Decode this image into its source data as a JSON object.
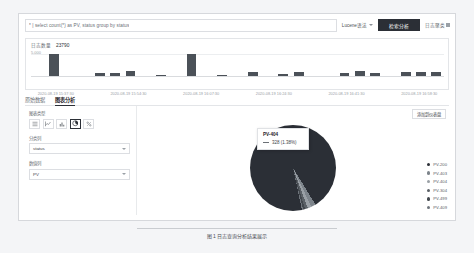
{
  "search": {
    "query": "* | select count(*) as PV, status group by status",
    "placeholder": "请输入查询语句",
    "syntax_label": "Lucene语法",
    "search_button": "检索分析",
    "right_link": "日志聚类",
    "right_link_badge": "新"
  },
  "histogram": {
    "count_label": "日志数量",
    "count_value": "23790",
    "ytick": "5,000",
    "xlabels": [
      "2020-08-19 15:37:30",
      "2020-08-19 15:54:30",
      "2020-08-19 16:07:30",
      "2020-08-19 16:24:30",
      "2020-08-19 16:41:30",
      "2020-08-19 16:58:30"
    ]
  },
  "tabs": [
    {
      "label": "原始数据",
      "active": false
    },
    {
      "label": "图表分析",
      "active": true
    }
  ],
  "controls": {
    "chart_type_label": "图表类型",
    "chart_types": [
      {
        "name": "table-icon",
        "selected": false
      },
      {
        "name": "line-chart-icon",
        "selected": false
      },
      {
        "name": "bar-chart-icon",
        "selected": false
      },
      {
        "name": "pie-chart-icon",
        "selected": true
      },
      {
        "name": "percent-icon",
        "selected": false
      }
    ],
    "category_label": "分类列",
    "category_value": "status",
    "value_label": "数值列",
    "value_value": "PV"
  },
  "dashboard_button": "添加到仪表盘",
  "tooltip": {
    "title": "PV-404",
    "value": "328 (1.38%)"
  },
  "colors": {
    "accent": "#2b2f36",
    "bar": "#4b5158",
    "panel_border": "#e3e5e8"
  },
  "chart_data": {
    "type": "pie",
    "title": "",
    "categories": [
      "PV-200",
      "PV-403",
      "PV-404",
      "PV-304",
      "PV-499",
      "PV-409"
    ],
    "values": [
      22500,
      420,
      328,
      260,
      180,
      102
    ],
    "percents": [
      "94.57%",
      "1.77%",
      "1.38%",
      "1.09%",
      "0.76%",
      "0.43%"
    ],
    "colors": [
      "#2b2f36",
      "#7d848b",
      "#9aa0a6",
      "#5a6066",
      "#42474d",
      "#6e747b"
    ],
    "legend_position": "right",
    "highlighted": "PV-404"
  },
  "histogram_chart": {
    "type": "bar",
    "ylabel": "",
    "xlabel": "",
    "ylim": [
      0,
      6000
    ],
    "values": [
      0,
      5200,
      0,
      0,
      700,
      750,
      1100,
      0,
      200,
      0,
      5300,
      0,
      150,
      0,
      900,
      0,
      520,
      880,
      0,
      0,
      700,
      1150,
      620,
      0,
      980,
      1050,
      900
    ]
  },
  "caption": "图 1  日志查询分析结果展示"
}
